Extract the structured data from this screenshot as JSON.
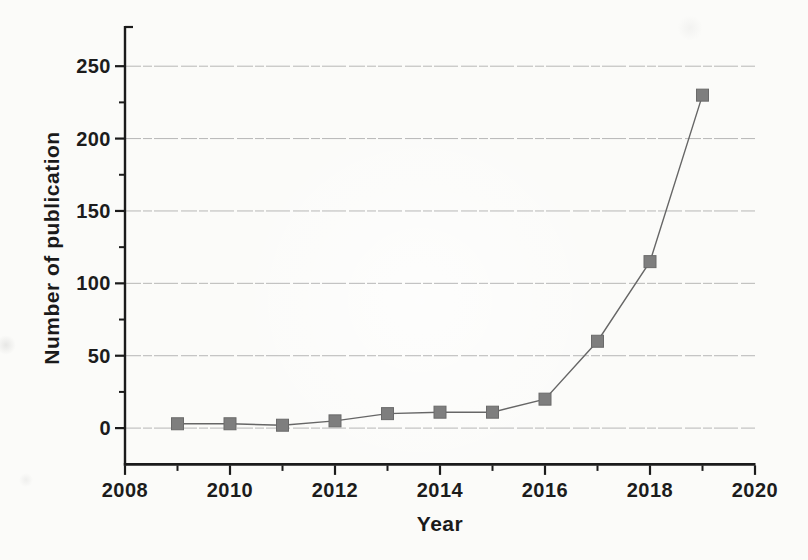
{
  "chart_data": {
    "type": "line",
    "title": "",
    "xlabel": "Year",
    "ylabel": "Number of publication",
    "series": [
      {
        "name": "Number of publication",
        "x": [
          2009,
          2010,
          2011,
          2012,
          2013,
          2014,
          2015,
          2016,
          2017,
          2018,
          2019
        ],
        "values": [
          3,
          3,
          2,
          5,
          10,
          11,
          11,
          20,
          60,
          115,
          230
        ]
      }
    ],
    "xlim": [
      2008,
      2020
    ],
    "ylim": [
      -25,
      275
    ],
    "x_major_ticks": [
      2008,
      2010,
      2012,
      2014,
      2016,
      2018,
      2020
    ],
    "x_minor_ticks": [
      2009,
      2011,
      2013,
      2015,
      2017,
      2019
    ],
    "y_major_ticks": [
      0,
      50,
      100,
      150,
      200,
      250
    ],
    "y_minor_ticks": [
      25,
      75,
      125,
      175,
      225
    ],
    "grid": "horizontal-major",
    "legend": "none",
    "marker": "square",
    "colors": {
      "marker_fill": "#7e7e7e",
      "marker_edge": "#6a6a6a",
      "line": "#666666",
      "axis": "#1b1b1b",
      "grid": "#b0b0b0",
      "text": "#1a1a1a",
      "background": "#fbfbf9"
    }
  }
}
